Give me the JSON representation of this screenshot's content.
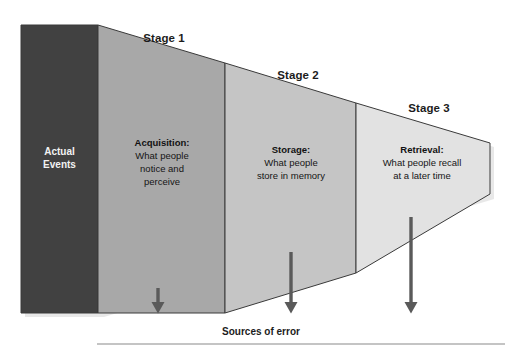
{
  "diagram": {
    "type": "funnel-process-diagram",
    "colors": {
      "actual_events_fill": "#414141",
      "stage1_fill": "#a8a8a8",
      "stage2_fill": "#c5c5c5",
      "stage3_fill": "#e2e2e2",
      "outline": "#3a3a3a",
      "arrow": "#5a5a5a",
      "rule": "#8a8a8a",
      "background": "#ffffff"
    },
    "source_block": {
      "label_line1": "Actual",
      "label_line2": "Events"
    },
    "stages": [
      {
        "stage_label": "Stage 1",
        "title": "Acquisition:",
        "lines": [
          "What people",
          "notice and",
          "perceive"
        ]
      },
      {
        "stage_label": "Stage 2",
        "title": "Storage:",
        "lines": [
          "What people",
          "store in memory"
        ]
      },
      {
        "stage_label": "Stage 3",
        "title": "Retrieval:",
        "lines": [
          "What people recall",
          "at a later time"
        ]
      }
    ],
    "footer": {
      "sources_label": "Sources of error",
      "arrow_count": 3
    }
  }
}
